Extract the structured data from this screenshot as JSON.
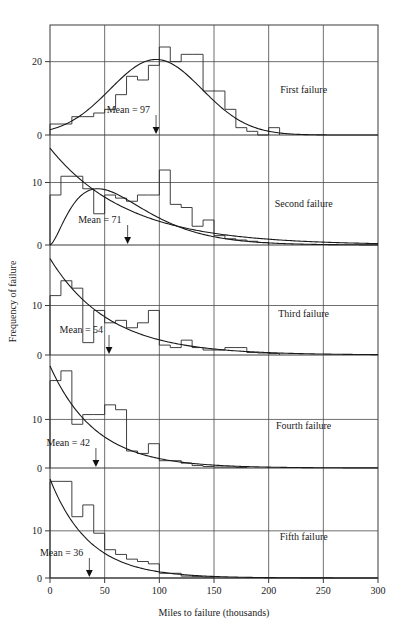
{
  "chart_data": {
    "type": "bar",
    "title": "",
    "subtitle": "",
    "xlabel": "Miles to failure (thousands)",
    "ylabel": "Frequency of failure",
    "xlim": [
      0,
      300
    ],
    "xticks": [
      0,
      50,
      100,
      150,
      200,
      250,
      300
    ],
    "xticklabels": [
      "0",
      "50",
      "100",
      "150",
      "200",
      "250",
      "300"
    ],
    "grid": true,
    "legend_position": "inside-right",
    "bin_width": 10,
    "note": "Five stacked histogram panels of miles-to-failure, each overlaid with fitted density curve(s) and a mean marker arrow.",
    "panels": [
      {
        "label": "First failure",
        "mean_label": "Mean = 97",
        "mean": 97,
        "yticks": [
          0,
          20
        ],
        "yticklabels": [
          "0",
          "20"
        ],
        "ylim": [
          0,
          30
        ],
        "bin_edges": [
          0,
          10,
          20,
          30,
          40,
          50,
          60,
          70,
          80,
          90,
          100,
          110,
          120,
          130,
          140,
          150,
          160,
          170,
          180,
          190,
          200,
          210
        ],
        "values": [
          3,
          3,
          5,
          5,
          6,
          7,
          11,
          16,
          15,
          19,
          24,
          20,
          22,
          22,
          12,
          12,
          7,
          2,
          1,
          0,
          2
        ],
        "curve": {
          "type": "normal",
          "mean": 97,
          "sd": 42,
          "peak": 20.6
        }
      },
      {
        "label": "Second failure",
        "mean_label": "Mean = 71",
        "mean": 71,
        "yticks": [
          0,
          10
        ],
        "yticklabels": [
          "0",
          "10"
        ],
        "ylim": [
          0,
          16
        ],
        "bin_edges": [
          0,
          10,
          20,
          30,
          40,
          50,
          60,
          70,
          80,
          90,
          100,
          110,
          120,
          130,
          140,
          150,
          160,
          170,
          180,
          190,
          200
        ],
        "values": [
          8,
          11,
          11,
          9,
          5,
          8,
          7.5,
          7,
          8,
          8,
          12,
          6.5,
          6,
          3,
          4,
          1.5,
          1,
          0.8,
          0.6,
          0.4
        ],
        "curves": [
          {
            "type": "exponential",
            "start": 15.5,
            "mean": 71
          },
          {
            "type": "gamma",
            "mean": 71,
            "peak": 9,
            "peak_x": 68
          }
        ]
      },
      {
        "label": "Third failure",
        "mean_label": "Mean = 54",
        "mean": 54,
        "yticks": [
          0,
          10
        ],
        "yticklabels": [
          "0",
          "10"
        ],
        "ylim": [
          0,
          20
        ],
        "bin_edges": [
          0,
          10,
          20,
          30,
          40,
          50,
          60,
          70,
          80,
          90,
          100,
          110,
          120,
          130,
          140,
          150,
          160,
          170,
          180,
          190,
          200,
          210
        ],
        "values": [
          12,
          15,
          13.5,
          2.5,
          9,
          6.5,
          7,
          5.5,
          6.5,
          9,
          2,
          1.5,
          3,
          1.5,
          1,
          1,
          1.5,
          1.5,
          0.5,
          0.4,
          0.3
        ],
        "curve": {
          "type": "exponential",
          "start": 19.5,
          "mean": 54
        }
      },
      {
        "label": "Fourth failure",
        "mean_label": "Mean = 42",
        "mean": 42,
        "yticks": [
          0,
          10
        ],
        "yticklabels": [
          "0",
          "10"
        ],
        "ylim": [
          0,
          21
        ],
        "bin_edges": [
          0,
          10,
          20,
          30,
          40,
          50,
          60,
          70,
          80,
          90,
          100,
          110,
          120,
          130,
          140,
          150,
          160,
          170,
          180
        ],
        "values": [
          18,
          20,
          9,
          11,
          11,
          13,
          12,
          3.5,
          3,
          5,
          1.5,
          1.5,
          1,
          0.5,
          0.3,
          0.2,
          0.2,
          0.1
        ],
        "curve": {
          "type": "exponential",
          "start": 21,
          "mean": 42
        }
      },
      {
        "label": "Fifth failure",
        "mean_label": "Mean = 36",
        "mean": 36,
        "yticks": [
          0,
          10
        ],
        "yticklabels": [
          "0",
          "10"
        ],
        "ylim": [
          0,
          21
        ],
        "bin_edges": [
          0,
          10,
          20,
          30,
          40,
          50,
          60,
          70,
          80,
          90,
          100,
          110,
          120,
          130,
          140,
          150
        ],
        "values": [
          20.5,
          20.5,
          13,
          15.5,
          9.5,
          6,
          5,
          4,
          3.5,
          3,
          1,
          1,
          0.4,
          0.3,
          0.2
        ],
        "curve": {
          "type": "exponential",
          "start": 21,
          "mean": 36
        }
      }
    ]
  },
  "figure": {
    "xlabel": "Miles to failure (thousands)",
    "ylabel": "Frequency of failure"
  }
}
